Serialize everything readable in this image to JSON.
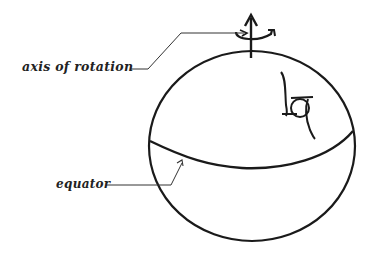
{
  "diagram": {
    "type": "sphere-rotation",
    "labels": {
      "axis": "axis of rotation",
      "equator": "equator"
    },
    "colors": {
      "stroke": "#1a1a1a",
      "leader": "#333333",
      "background": "#ffffff"
    },
    "elements": [
      {
        "name": "sphere",
        "shape": "circle"
      },
      {
        "name": "equator-curve",
        "shape": "curve"
      },
      {
        "name": "rotation-axis-arrow",
        "shape": "arrow-up"
      },
      {
        "name": "rotation-direction-arrow",
        "shape": "curved-arrow"
      },
      {
        "name": "hand-drawn-symbol",
        "shape": "glyph"
      }
    ]
  }
}
